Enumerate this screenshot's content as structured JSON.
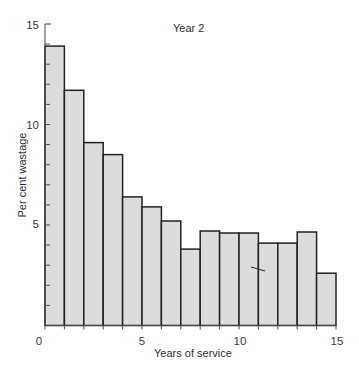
{
  "chart_data": {
    "type": "bar",
    "title": "Year 2",
    "xlabel": "Years of service",
    "ylabel": "Per cent wastage",
    "x_bin_edges": [
      0,
      1,
      2,
      3,
      4,
      5,
      6,
      7,
      8,
      9,
      10,
      11,
      12,
      13,
      14,
      15
    ],
    "categories": [
      "0-1",
      "1-2",
      "2-3",
      "3-4",
      "4-5",
      "5-6",
      "6-7",
      "7-8",
      "8-9",
      "9-10",
      "10-11",
      "11-12",
      "12-13",
      "13-14",
      "14-15"
    ],
    "values": [
      13.9,
      11.7,
      9.1,
      8.5,
      6.4,
      5.9,
      5.2,
      3.8,
      4.7,
      4.6,
      4.6,
      4.1,
      4.1,
      4.65,
      2.6
    ],
    "xlim": [
      0,
      15
    ],
    "ylim": [
      0,
      15
    ],
    "x_ticks": [
      0,
      5,
      10,
      15
    ],
    "y_ticks": [
      5,
      10,
      15
    ],
    "y_minor_tick_step": 1,
    "grid": false,
    "legend": null,
    "style": {
      "bar_fill": "#dcdcdc",
      "bar_edge": "#222222",
      "axis_color": "#444444"
    }
  },
  "labels": {
    "title": "Year 2",
    "xlabel": "Years of service",
    "ylabel": "Per cent wastage",
    "x_tick_0": "0",
    "x_tick_5": "5",
    "x_tick_10": "10",
    "x_tick_15": "15",
    "y_tick_5": "5",
    "y_tick_10": "10",
    "y_tick_15": "15"
  }
}
